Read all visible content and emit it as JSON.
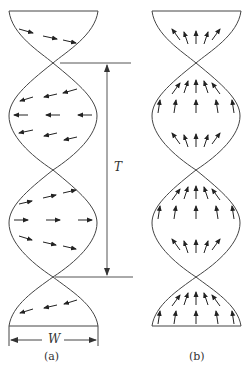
{
  "figure": {
    "panels": [
      {
        "id": "a",
        "caption": "(a)",
        "arrow_orientation": "in-plane (horizontal, rotating with twist)"
      },
      {
        "id": "b",
        "caption": "(b)",
        "arrow_orientation": "out-of-plane (upward, fanning at edges)"
      }
    ],
    "dimensions": {
      "period_label": "T",
      "width_label": "W"
    },
    "colors": {
      "stroke": "#333333",
      "background": "#ffffff"
    }
  }
}
